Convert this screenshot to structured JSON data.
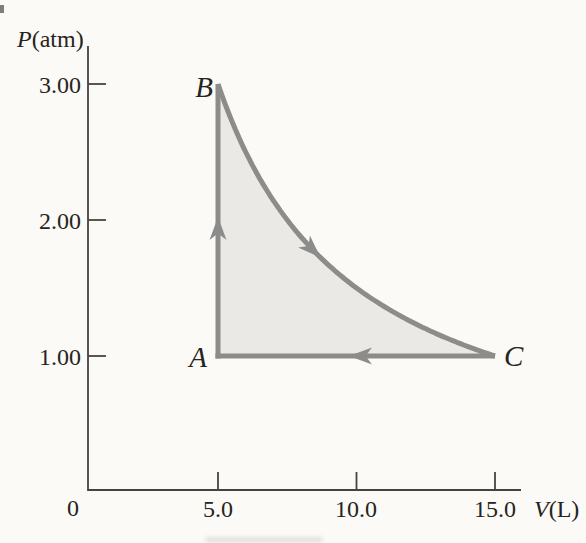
{
  "figure": {
    "kind": "textbook PV-diagram of a thermodynamic cycle",
    "background_color": "#fbfaf7"
  },
  "axes": {
    "ylabel": "P(atm)",
    "ylabel_parts": {
      "symbol": "P",
      "unit": "(atm)"
    },
    "xlabel": "V(L)",
    "xlabel_parts": {
      "symbol": "V",
      "unit": "(L)"
    },
    "origin_label": "0",
    "y_ticks": [
      {
        "value": 3.0,
        "label": "3.00"
      },
      {
        "value": 2.0,
        "label": "2.00"
      },
      {
        "value": 1.0,
        "label": "1.00"
      }
    ],
    "x_ticks": [
      {
        "value": 5.0,
        "label": "5.0"
      },
      {
        "value": 10.0,
        "label": "10.0"
      },
      {
        "value": 15.0,
        "label": "15.0"
      }
    ]
  },
  "chart_data": {
    "type": "line",
    "title": "",
    "xlabel": "V(L)",
    "ylabel": "P(atm)",
    "xlim": [
      0,
      16.9
    ],
    "ylim": [
      0,
      3.45
    ],
    "grid": false,
    "legend": false,
    "points": [
      {
        "label": "A",
        "V": 5.0,
        "P": 1.0
      },
      {
        "label": "B",
        "V": 5.0,
        "P": 3.0
      },
      {
        "label": "C",
        "V": 15.0,
        "P": 1.0
      }
    ],
    "segments": [
      {
        "name": "A to B",
        "shape": "vertical-line",
        "from": "A",
        "to": "B",
        "arrow_direction": "up"
      },
      {
        "name": "B to C",
        "shape": "hyperbola PV=const",
        "pv_constant": 15.0,
        "from": "B",
        "to": "C",
        "arrow_direction": "down-right along curve",
        "curve_points": [
          {
            "V": 5.0,
            "P": 3.0
          },
          {
            "V": 7.5,
            "P": 2.0
          },
          {
            "V": 10.0,
            "P": 1.5
          },
          {
            "V": 12.5,
            "P": 1.2
          },
          {
            "V": 15.0,
            "P": 1.0
          }
        ]
      },
      {
        "name": "C to A",
        "shape": "horizontal-line",
        "from": "C",
        "to": "A",
        "arrow_direction": "left"
      }
    ],
    "shaded_region": "area enclosed by cycle A-B-C",
    "colors": {
      "process_stroke": "#8c8c8a",
      "shaded_fill": "#eae9e5",
      "axis_line": "#45433f",
      "text": "#262420"
    }
  }
}
